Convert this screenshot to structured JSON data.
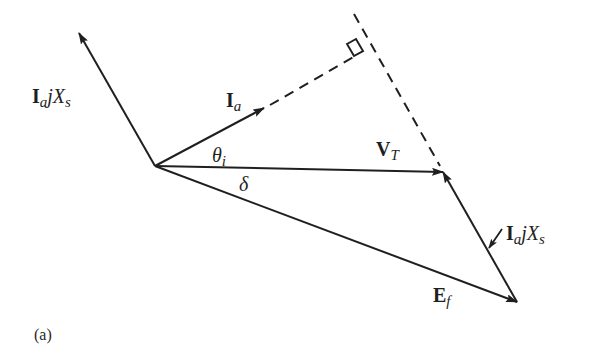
{
  "figure": {
    "caption": "(a)",
    "colors": {
      "background": "#ffffff",
      "ink": "#1f1f1f"
    }
  },
  "vectors": [
    {
      "id": "Ia",
      "from": [
        155,
        166
      ],
      "to": [
        264,
        108
      ],
      "style": "solid"
    },
    {
      "id": "VT",
      "from": [
        155,
        166
      ],
      "to": [
        443,
        172
      ],
      "style": "solid"
    },
    {
      "id": "Ef",
      "from": [
        155,
        166
      ],
      "to": [
        517,
        302
      ],
      "style": "solid"
    },
    {
      "id": "IajXs_left",
      "from": [
        155,
        166
      ],
      "to": [
        79,
        33
      ],
      "style": "solid"
    },
    {
      "id": "IajXs_right",
      "from": [
        517,
        302
      ],
      "to": [
        443,
        172
      ],
      "style": "solid"
    }
  ],
  "construction_lines": [
    {
      "id": "Ia_extension",
      "from": [
        264,
        108
      ],
      "to": [
        357,
        55
      ],
      "style": "dashed"
    },
    {
      "id": "perpendicular",
      "from": [
        354,
        14
      ],
      "to": [
        443,
        172
      ],
      "style": "dashed"
    }
  ],
  "right_angle_marker": {
    "corner": [
      357,
      55
    ]
  },
  "labels": {
    "IajXs_left": {
      "main": "I",
      "sub": "a",
      "rest": "j",
      "var": "X",
      "var_sub": "s"
    },
    "Ia": {
      "main": "I",
      "sub": "a"
    },
    "theta_i": {
      "main": "θ",
      "sub": "i"
    },
    "delta": {
      "main": "δ"
    },
    "VT": {
      "main": "V",
      "sub": "T"
    },
    "IajXs_right": {
      "main": "I",
      "sub": "a",
      "rest": "j",
      "var": "X",
      "var_sub": "s"
    },
    "Ef": {
      "main": "E",
      "sub": "f"
    }
  }
}
